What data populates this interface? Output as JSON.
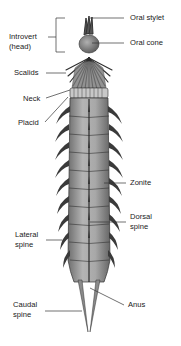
{
  "diagram": {
    "labels": {
      "oral_stylet": "Oral stylet",
      "oral_cone": "Oral cone",
      "introvert_line1": "Introvert",
      "introvert_line2": "(head)",
      "scalids": "Scalids",
      "neck": "Neck",
      "placid": "Placid",
      "zonite": "Zonite",
      "dorsal_spine_line1": "Dorsal",
      "dorsal_spine_line2": "spine",
      "lateral_spine_line1": "Lateral",
      "lateral_spine_line2": "spine",
      "caudal_spine_line1": "Caudal",
      "caudal_spine_line2": "spine",
      "anus": "Anus"
    },
    "colors": {
      "body": "#9a9a9a",
      "body_dark": "#5e5e5e",
      "outline": "#3a3a3a",
      "leader_line": "#333333",
      "text": "#1a1a1a"
    }
  }
}
